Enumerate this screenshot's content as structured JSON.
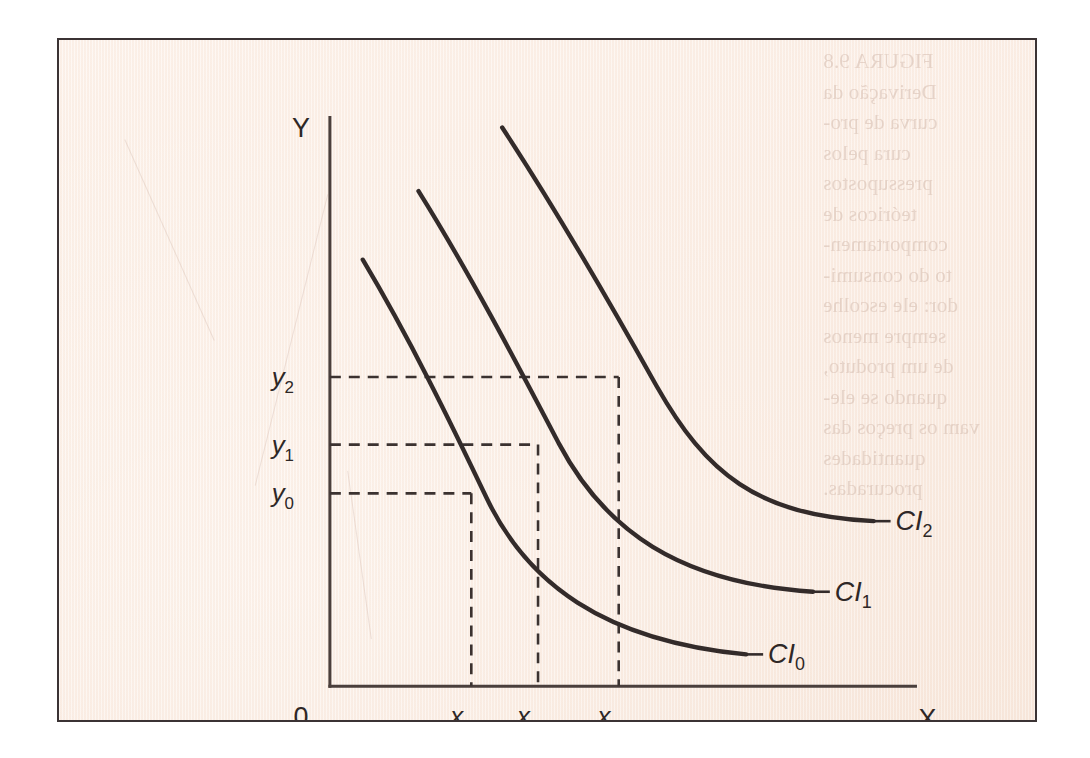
{
  "figure": {
    "background_color": "#fbeee5",
    "ink_color": "#332b2a",
    "border_color": "#3b3334",
    "bleed_through_text": "FIGURA 9.8\nDerivação da\ncurva de pro-\ncura pelos\npressupostos\nteóricos de\ncomportamen-\nto do consumi-\ndor: ele escolhe\nsempre menos\nde um produto,\nquando se ele-\nvam os preços das\nquantidades\nprocuradas."
  },
  "chart_data": {
    "type": "line",
    "title": "",
    "xlabel": "X",
    "ylabel": "Y",
    "origin_label": "0",
    "grid": false,
    "legend_position": "right-of-curve-end",
    "x_tick_labels": [
      "x0",
      "x1",
      "x2"
    ],
    "y_tick_labels": [
      "y0",
      "y1",
      "y2"
    ],
    "xlim": [
      0,
      10
    ],
    "ylim": [
      0,
      10
    ],
    "series": [
      {
        "name": "CI0",
        "label_base": "CI",
        "label_sub": "0",
        "path": "M 305 221 C 352 300 392 382 430 462 C 470 545 545 604 690 618",
        "label_x": 712,
        "label_y": 627,
        "leader": "M 690 618 L 707 618"
      },
      {
        "name": "CI1",
        "label_base": "CI",
        "label_sub": "1",
        "path": "M 361 152 C 412 234 458 322 502 406 C 548 493 622 546 757 555",
        "label_x": 779,
        "label_y": 564,
        "leader": "M 757 555 L 774 555"
      },
      {
        "name": "CI2",
        "label_base": "CI",
        "label_sub": "2",
        "path": "M 445 88 C 500 172 552 262 600 348 C 650 436 700 478 818 484",
        "label_x": 840,
        "label_y": 493,
        "leader": "M 818 484 L 835 484"
      }
    ],
    "marked_points": [
      {
        "name": "p0",
        "x_label": "x0",
        "y_label": "y0",
        "px": 414,
        "py": 456,
        "on_curve": "CI0"
      },
      {
        "name": "p1",
        "x_label": "x1",
        "y_label": "y1",
        "px": 481,
        "py": 407,
        "on_curve": "CI1"
      },
      {
        "name": "p2",
        "x_label": "x2",
        "y_label": "y2",
        "px": 562,
        "py": 339,
        "on_curve": "CI2"
      }
    ],
    "annotations": []
  },
  "axes": {
    "y_axis_label": "Y",
    "x_axis_label": "X",
    "origin": "0",
    "y_axis_x": 272,
    "y_axis_top": 78,
    "x_axis_y": 650,
    "x_axis_right": 860
  },
  "y_ticks": [
    {
      "base": "y",
      "sub": "2",
      "px": 339,
      "label_x": 236,
      "label_y": 348
    },
    {
      "base": "y",
      "sub": "1",
      "px": 407,
      "label_x": 236,
      "label_y": 416
    },
    {
      "base": "y",
      "sub": "0",
      "px": 456,
      "label_x": 236,
      "label_y": 465
    }
  ],
  "x_ticks": [
    {
      "base": "x",
      "sub": "0",
      "px": 414,
      "label_x": 404,
      "label_y": 689
    },
    {
      "base": "x",
      "sub": "1",
      "px": 481,
      "label_x": 471,
      "label_y": 689
    },
    {
      "base": "x",
      "sub": "2",
      "px": 562,
      "label_x": 552,
      "label_y": 689
    }
  ],
  "guides": [
    {
      "name": "guide-y2-horizontal",
      "d": "M 272 339 L 562 339"
    },
    {
      "name": "guide-x2-vertical",
      "d": "M 562 339 L 562 650"
    },
    {
      "name": "guide-y1-horizontal",
      "d": "M 272 407 L 481 407"
    },
    {
      "name": "guide-x1-vertical",
      "d": "M 481 407 L 481 650"
    },
    {
      "name": "guide-y0-horizontal",
      "d": "M 272 456 L 414 456"
    },
    {
      "name": "guide-x0-vertical",
      "d": "M 414 456 L 414 650"
    }
  ]
}
